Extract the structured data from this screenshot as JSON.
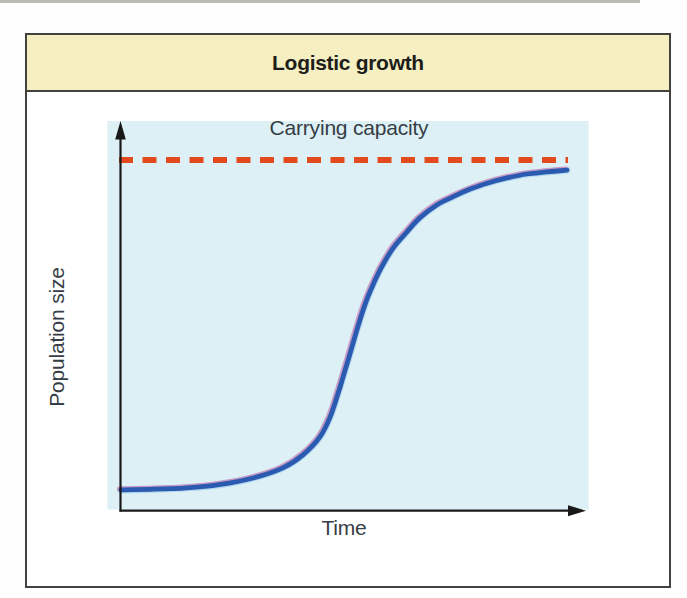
{
  "header": {
    "title": "Logistic growth"
  },
  "chart": {
    "carrying_capacity_label": "Carrying capacity",
    "xlabel": "Time",
    "ylabel": "Population size"
  },
  "colors": {
    "header_bg": "#f5efc1",
    "box_border": "#44423f",
    "title_text": "#1d1d1b",
    "label_text": "#363d45",
    "plot_bg": "#dcf0f6",
    "capacity_dash": "#e34a1e",
    "curve_blue": "#2b5ab1",
    "curve_halo_blue": "#7fb8e4",
    "curve_offset_pink": "#c884b8",
    "axis": "#191919"
  },
  "chart_data": {
    "type": "line",
    "title": "Logistic growth",
    "xlabel": "Time",
    "ylabel": "Population size",
    "x_axis": {
      "range": [
        0,
        1
      ],
      "ticks": "none",
      "arrow": true
    },
    "y_axis": {
      "range": [
        0,
        1.1
      ],
      "ticks": "none",
      "arrow": true
    },
    "grid": false,
    "legend": "none",
    "annotations": [
      {
        "text": "Carrying capacity",
        "type": "dashed-horizontal-line",
        "level": 1.0,
        "position": "above-line-centered"
      }
    ],
    "carrying_capacity_level": 1.0,
    "series": [
      {
        "name": "Population size (logistic S-curve)",
        "color": "#2b5ab1",
        "x": [
          0.0,
          0.075,
          0.148,
          0.22,
          0.296,
          0.363,
          0.408,
          0.446,
          0.469,
          0.487,
          0.498,
          0.514,
          0.529,
          0.543,
          0.558,
          0.581,
          0.61,
          0.641,
          0.67,
          0.708,
          0.744,
          0.783,
          0.821,
          0.866,
          0.91,
          0.955,
          1.0
        ],
        "y": [
          0.06,
          0.062,
          0.066,
          0.075,
          0.094,
          0.123,
          0.16,
          0.211,
          0.268,
          0.336,
          0.382,
          0.45,
          0.516,
          0.573,
          0.624,
          0.687,
          0.749,
          0.795,
          0.835,
          0.872,
          0.895,
          0.917,
          0.934,
          0.949,
          0.96,
          0.966,
          0.971
        ]
      }
    ]
  }
}
